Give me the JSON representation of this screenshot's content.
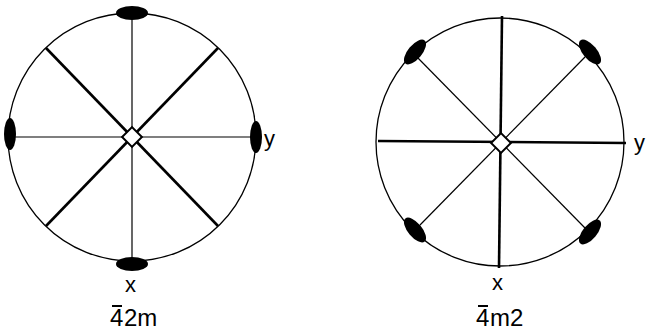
{
  "diagrams": [
    {
      "name": "4bar2m",
      "caption": "42m",
      "caption_bar_over": "4",
      "caption_rest": "2m",
      "axis_labels": {
        "x": "x",
        "y": "y"
      },
      "center": [
        132,
        137
      ],
      "radius": 124,
      "thick_lines": "diagonals",
      "lens_positions": "axes"
    },
    {
      "name": "4barm2",
      "caption": "4m2",
      "caption_bar_over": "4",
      "caption_rest": "m2",
      "axis_labels": {
        "x": "x",
        "y": "y"
      },
      "center": [
        500,
        142
      ],
      "radius": 124,
      "thick_lines": "axes",
      "lens_positions": "diagonals"
    }
  ],
  "colors": {
    "line": "#000000",
    "background": "#ffffff"
  }
}
